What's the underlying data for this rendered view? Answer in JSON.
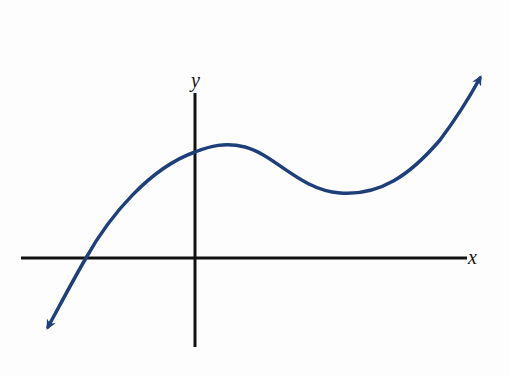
{
  "figure": {
    "type": "function-graph",
    "axes": {
      "x_label": "x",
      "y_label": "y",
      "axis_color": "#111111"
    },
    "curve": {
      "color": "#1f3f7a",
      "end_behavior": {
        "left": "down (arrow pointing lower-left)",
        "right": "up (arrow pointing upper-right)"
      },
      "features": {
        "x_intercepts": 1,
        "x_intercept_position": "negative x",
        "y_intercept_position": "positive y",
        "local_max": "slightly right of y-axis, above x-axis",
        "local_min": "right of y-axis, above x-axis"
      }
    }
  }
}
